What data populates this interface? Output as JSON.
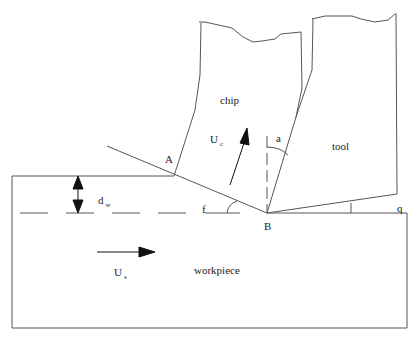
{
  "diagram": {
    "type": "orthogonal-cutting-model",
    "regions": {
      "chip": "chip",
      "tool": "tool",
      "workpiece": "workpiece"
    },
    "points": {
      "A": "A",
      "B": "B"
    },
    "angles": {
      "rake": "a",
      "shear": "f",
      "clearance": "q"
    },
    "velocities": {
      "chip": {
        "symbol": "U",
        "subscript": "c"
      },
      "workpiece": {
        "symbol": "U",
        "subscript": "s"
      }
    },
    "depth": {
      "symbol": "d",
      "subscript": "w"
    },
    "colors": {
      "line": "#555555",
      "arrow": "#111111",
      "background": "#ffffff"
    }
  }
}
